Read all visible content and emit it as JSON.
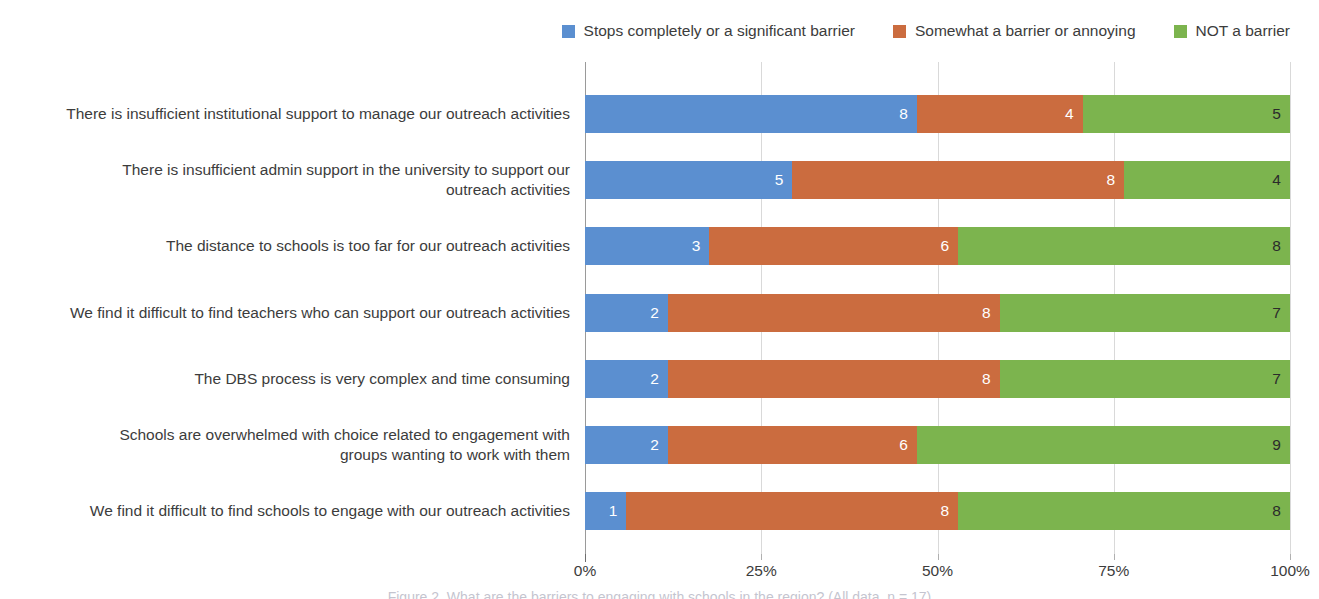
{
  "chart_data": {
    "type": "bar",
    "orientation": "horizontal",
    "stacked": true,
    "normalized": true,
    "title": "",
    "subtitle": "",
    "xlabel": "",
    "ylabel": "",
    "xlim": [
      0,
      100
    ],
    "xticks": [
      "0%",
      "25%",
      "50%",
      "75%",
      "100%"
    ],
    "xtick_values": [
      0,
      25,
      50,
      75,
      100
    ],
    "grid": true,
    "legend_position": "top-right",
    "value_total": 17,
    "categories": [
      "There is insufficient institutional support to manage our outreach activities",
      "There is insufficient admin support in the university to support our outreach activities",
      "The distance to schools is too far for our outreach activities",
      "We find it difficult to find teachers who can support our outreach activities",
      "The DBS process is very complex and time consuming",
      "Schools are overwhelmed with choice related to engagement with groups wanting to work with them",
      "We find it difficult to find schools to engage with our outreach activities"
    ],
    "category_lines": [
      [
        "There is insufficient institutional support to manage our outreach activities"
      ],
      [
        "There is insufficient admin support in the university to support our",
        "outreach activities"
      ],
      [
        "The distance to schools is too far for our outreach activities"
      ],
      [
        "We find it difficult to find teachers who can support our outreach activities"
      ],
      [
        "The DBS process is very complex and time consuming"
      ],
      [
        "Schools are overwhelmed with choice related to engagement with",
        "groups wanting to work with them"
      ],
      [
        "We find it difficult to find schools to engage with our outreach activities"
      ]
    ],
    "series": [
      {
        "name": "Stops completely or a significant barrier",
        "color": "#5b8fd0",
        "label_color": "#ffffff",
        "values": [
          8,
          5,
          3,
          2,
          2,
          2,
          1
        ]
      },
      {
        "name": "Somewhat a barrier or annoying",
        "color": "#cb6c3f",
        "label_color": "#ffffff",
        "values": [
          4,
          8,
          6,
          8,
          8,
          6,
          8
        ]
      },
      {
        "name": "NOT a barrier",
        "color": "#7cb44e",
        "label_color": "#2b2b2b",
        "values": [
          5,
          4,
          8,
          7,
          7,
          9,
          8
        ]
      }
    ]
  },
  "caption": {
    "text": "Figure 2. What are the barriers to engaging with schools in the region? (All data, n = 17)"
  },
  "colors": {
    "series_blue": "#5b8fd0",
    "series_orange": "#cb6c3f",
    "series_green": "#7cb44e",
    "gridline": "#d9d9d9",
    "axis": "#9a9a9a",
    "text": "#3c3c3c"
  }
}
